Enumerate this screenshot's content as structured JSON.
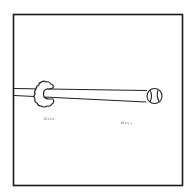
{
  "panel": {
    "description": "Comic panel: a long tube extends from the left edge through a puffy cloud-like ring toward a ball at the right; small grass tufts below",
    "border": {
      "x": 13,
      "y": 14,
      "w": 170,
      "h": 172,
      "color": "#1a1a1a"
    },
    "background": "#ffffff",
    "ink": "#222222"
  },
  "elements": {
    "tube": {
      "label": "tube"
    },
    "ring": {
      "label": "puff-ring"
    },
    "ball": {
      "label": "ball"
    },
    "grass": [
      {
        "label": "grass-tuft"
      },
      {
        "label": "grass-tuft"
      }
    ]
  }
}
